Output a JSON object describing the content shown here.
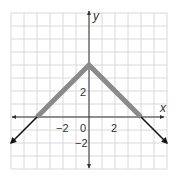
{
  "chart_data": {
    "type": "line",
    "title": "",
    "function": "y = 4 - |x|",
    "xlabel": "x",
    "ylabel": "y",
    "xlim": [
      -6,
      6
    ],
    "ylim": [
      -4,
      8
    ],
    "grid": true,
    "x_tick_labels": [
      "-2",
      "0",
      "2"
    ],
    "y_tick_labels": [
      "2",
      "-2"
    ],
    "origin_label": "0",
    "series": [
      {
        "name": "highlighted segment",
        "style": "thick gray",
        "x": [
          -4,
          0,
          4
        ],
        "y": [
          0,
          4,
          0
        ]
      },
      {
        "name": "left ray",
        "style": "black arrow",
        "x": [
          -4,
          -6
        ],
        "y": [
          0,
          -2
        ]
      },
      {
        "name": "right ray",
        "style": "black arrow",
        "x": [
          4,
          6
        ],
        "y": [
          0,
          -2
        ]
      }
    ],
    "colors": {
      "segment": "#8a8a8a",
      "ray": "#111111",
      "axis": "#333333",
      "grid": "#d8d8d8"
    }
  }
}
